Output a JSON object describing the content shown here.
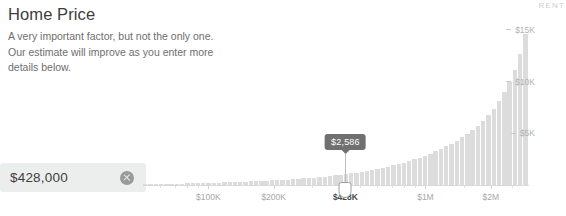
{
  "header": {
    "title": "Home Price",
    "description": "A very important factor, but not the only one. Our estimate will improve as you enter more details below."
  },
  "price_input": {
    "value": "$428,000",
    "placeholder": "$0",
    "clear_icon": "clear-circle-icon"
  },
  "tooltip": {
    "label": "$2,586"
  },
  "colors": {
    "bar": "#dcdcdc",
    "field_background": "#eceded",
    "tooltip_background": "#707070",
    "axis": "#d9d9d9",
    "tick_label": "#a8a8a8",
    "active_tick_label": "#4a4a4a"
  },
  "chart_data": {
    "type": "bar",
    "title": "",
    "xlabel": "",
    "ylabel": "RENT",
    "grid": false,
    "legend": null,
    "x_scale": "log",
    "xlim": [
      50000,
      3000000
    ],
    "ylim": [
      0,
      17500
    ],
    "x_tick_labels": [
      "$100K",
      "$200K",
      "$428K",
      "$1M",
      "$2M"
    ],
    "x_tick_values": [
      100000,
      200000,
      428000,
      1000000,
      2000000
    ],
    "active_x_tick": "$428K",
    "y_tick_labels": [
      "$5K",
      "$10K",
      "$15K"
    ],
    "y_tick_values": [
      5000,
      10000,
      15000
    ],
    "marker": {
      "x_value": 428000,
      "x_label": "$428K",
      "y_value": 2586,
      "y_label": "$2,586"
    },
    "categories": [
      "b1",
      "b2",
      "b3",
      "b4",
      "b5",
      "b6",
      "b7",
      "b8",
      "b9",
      "b10",
      "b11",
      "b12",
      "b13",
      "b14",
      "b15",
      "b16",
      "b17",
      "b18",
      "b19",
      "b20",
      "b21",
      "b22",
      "b23",
      "b24",
      "b25",
      "b26",
      "b27",
      "b28",
      "b29",
      "b30",
      "b31",
      "b32",
      "b33",
      "b34",
      "b35",
      "b36",
      "b37",
      "b38",
      "b39",
      "b40",
      "b41",
      "b42",
      "b43",
      "b44",
      "b45",
      "b46",
      "b47",
      "b48",
      "b49",
      "b50",
      "b51",
      "b52",
      "b53",
      "b54",
      "b55",
      "b56",
      "b57",
      "b58",
      "b59",
      "b60",
      "b61",
      "b62",
      "b63",
      "b64",
      "b65",
      "b66",
      "b67",
      "b68",
      "b69",
      "b70",
      "b71",
      "b72",
      "b73"
    ],
    "values": [
      60,
      70,
      80,
      90,
      100,
      110,
      125,
      135,
      150,
      160,
      175,
      190,
      200,
      215,
      230,
      245,
      260,
      280,
      300,
      320,
      340,
      365,
      390,
      415,
      440,
      470,
      500,
      530,
      565,
      600,
      640,
      680,
      725,
      770,
      820,
      875,
      930,
      990,
      1055,
      1125,
      1200,
      1280,
      1365,
      1455,
      1555,
      1660,
      1775,
      1895,
      2025,
      2165,
      2315,
      2475,
      2650,
      2835,
      3035,
      3250,
      3480,
      3730,
      4000,
      4290,
      4605,
      4950,
      5330,
      5750,
      6220,
      6760,
      7380,
      8100,
      8950,
      9950,
      11150,
      12650,
      14600
    ]
  }
}
